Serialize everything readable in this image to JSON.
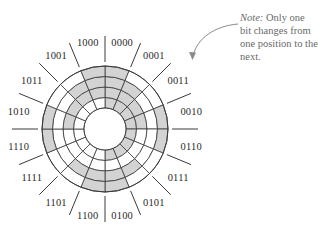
{
  "figure": {
    "center": [
      105,
      129
    ],
    "radii": {
      "hole": 21,
      "rings": [
        31.5,
        42,
        52.5,
        63
      ]
    },
    "tick": {
      "inner": 67,
      "outer": 93
    },
    "label_radius": 88,
    "colors": {
      "shaded": "#d3d3d3",
      "unshaded": "#ffffff",
      "line": "#3a3a3a",
      "arrow": "#8a8a8a",
      "note_text": "#6a6a6a"
    },
    "shading_rule": "shaded segment = bit value 0; outer ring = LSB, inner ring = MSB",
    "sectors_clockwise_from_top": [
      "0000",
      "0001",
      "0011",
      "0010",
      "0110",
      "0111",
      "0101",
      "0100",
      "1100",
      "1101",
      "1111",
      "1110",
      "1010",
      "1011",
      "1001",
      "1000"
    ]
  },
  "note": {
    "prefix": "Note:",
    "text": " Only one bit changes from one position to the next."
  }
}
